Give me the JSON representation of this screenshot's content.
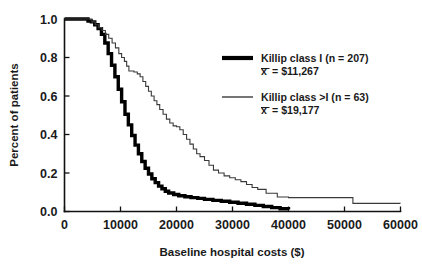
{
  "chart_data": {
    "type": "line",
    "title": "",
    "xlabel": "Baseline hospital costs ($)",
    "ylabel": "Percent of patients",
    "xlim": [
      0,
      60000
    ],
    "ylim": [
      0.0,
      1.0
    ],
    "grid": false,
    "legend_position": "upper-right",
    "xticks": [
      0,
      10000,
      20000,
      30000,
      40000,
      50000,
      60000
    ],
    "xtick_labels": [
      "0",
      "10000",
      "20000",
      "30000",
      "40000",
      "50000",
      "60000"
    ],
    "yticks": [
      0.0,
      0.2,
      0.4,
      0.6,
      0.8,
      1.0
    ],
    "ytick_labels": [
      "0.0",
      "0.2",
      "0.4",
      "0.6",
      "0.8",
      "1.0"
    ],
    "series": [
      {
        "name": "Killip class I (n = 207)",
        "mean_label": "x̄ = $11,267",
        "mean_value": 11267,
        "n": 207,
        "style": "thick",
        "color": "#000000",
        "x": [
          0,
          3600,
          4200,
          4800,
          5400,
          6000,
          6600,
          7200,
          7800,
          8400,
          9000,
          9600,
          10200,
          10800,
          11400,
          12000,
          12600,
          13200,
          13800,
          14400,
          15000,
          15600,
          16200,
          16800,
          17400,
          18000,
          18600,
          19500,
          20400,
          21500,
          22600,
          23800,
          25000,
          26500,
          28000,
          29500,
          31000,
          32500,
          34000,
          35500,
          37000,
          38500,
          40000
        ],
        "y": [
          1.0,
          1.0,
          0.99,
          0.985,
          0.97,
          0.95,
          0.92,
          0.875,
          0.82,
          0.76,
          0.7,
          0.635,
          0.57,
          0.505,
          0.45,
          0.395,
          0.345,
          0.3,
          0.26,
          0.225,
          0.195,
          0.17,
          0.15,
          0.132,
          0.118,
          0.105,
          0.096,
          0.088,
          0.082,
          0.077,
          0.072,
          0.068,
          0.063,
          0.058,
          0.053,
          0.048,
          0.043,
          0.038,
          0.032,
          0.026,
          0.02,
          0.014,
          0.01
        ]
      },
      {
        "name": "Killip class >I (n = 63)",
        "mean_label": "x̄ = $19,177",
        "mean_value": 19177,
        "n": 63,
        "style": "thin",
        "color": "#3a3a3a",
        "x": [
          0,
          4200,
          4900,
          5500,
          6100,
          6700,
          7300,
          7900,
          8500,
          9100,
          9700,
          10200,
          10700,
          11100,
          11500,
          12400,
          13000,
          13500,
          14000,
          14500,
          15000,
          15500,
          16000,
          16500,
          17000,
          17600,
          18200,
          18800,
          19400,
          20000,
          20600,
          21200,
          21800,
          22400,
          23000,
          23600,
          24200,
          25000,
          25800,
          26600,
          27500,
          28500,
          29500,
          30500,
          31500,
          32500,
          33500,
          34500,
          36000,
          38000,
          40000,
          42000,
          44000,
          46000,
          48000,
          50500,
          51500,
          60000
        ],
        "y": [
          1.0,
          1.0,
          0.985,
          0.97,
          0.955,
          0.94,
          0.92,
          0.9,
          0.875,
          0.85,
          0.82,
          0.8,
          0.78,
          0.755,
          0.73,
          0.725,
          0.715,
          0.7,
          0.675,
          0.65,
          0.625,
          0.6,
          0.575,
          0.555,
          0.53,
          0.505,
          0.48,
          0.46,
          0.445,
          0.44,
          0.425,
          0.4,
          0.375,
          0.35,
          0.325,
          0.3,
          0.285,
          0.265,
          0.24,
          0.215,
          0.2,
          0.185,
          0.175,
          0.165,
          0.155,
          0.14,
          0.125,
          0.115,
          0.095,
          0.075,
          0.072,
          0.072,
          0.072,
          0.072,
          0.072,
          0.072,
          0.042,
          0.042
        ]
      }
    ]
  },
  "axes": {
    "ylabel": "Percent of patients",
    "xlabel": "Baseline hospital costs ($)"
  },
  "legend": {
    "entries": [
      {
        "label": "Killip class I (n = 207)",
        "mean": "= $11,267",
        "symbol": "x̄"
      },
      {
        "label": "Killip class >I (n = 63)",
        "mean": "= $19,177",
        "symbol": "x̄"
      }
    ]
  }
}
